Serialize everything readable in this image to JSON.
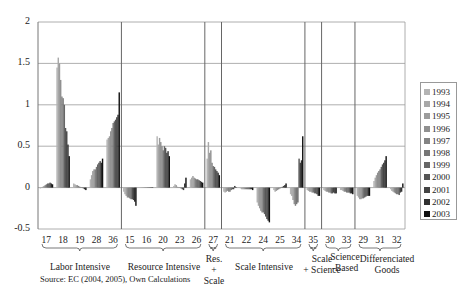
{
  "chart_data": {
    "type": "bar",
    "title": "",
    "xlabel": "",
    "ylabel": "",
    "ylim": [
      -0.5,
      2
    ],
    "yticks": [
      "2",
      "1.5",
      "1",
      "0.5",
      "0",
      "-0.5"
    ],
    "grid": true,
    "legend_position": "right",
    "series_names": [
      "1993",
      "1994",
      "1995",
      "1996",
      "1997",
      "1998",
      "1999",
      "2000",
      "2001",
      "2002",
      "2003"
    ],
    "series_colors": [
      "#b4b4b4",
      "#a8a8a8",
      "#9c9c9c",
      "#909090",
      "#838383",
      "#767676",
      "#666666",
      "#555555",
      "#444444",
      "#303030",
      "#111111"
    ],
    "categories": [
      "17",
      "18",
      "19",
      "28",
      "36",
      "15",
      "16",
      "20",
      "23",
      "26",
      "27",
      "21",
      "22",
      "24",
      "25",
      "34",
      "35",
      "30",
      "33",
      "29",
      "31",
      "32"
    ],
    "values": {
      "17": [
        -0.01,
        0.0,
        0.01,
        0.02,
        0.03,
        0.04,
        0.05,
        0.05,
        0.06,
        0.05,
        0.04
      ],
      "18": [
        1.45,
        1.57,
        1.5,
        1.3,
        1.1,
        1.08,
        1.0,
        0.72,
        0.68,
        0.52,
        0.38
      ],
      "19": [
        0.05,
        0.04,
        0.03,
        0.03,
        0.02,
        0.01,
        0.0,
        0.0,
        -0.01,
        -0.02,
        -0.03
      ],
      "28": [
        0.1,
        0.15,
        0.2,
        0.22,
        0.22,
        0.25,
        0.28,
        0.3,
        0.32,
        0.3,
        0.35
      ],
      "36": [
        0.58,
        0.6,
        0.62,
        0.68,
        0.72,
        0.78,
        0.8,
        0.82,
        0.85,
        0.88,
        1.15
      ],
      "15": [
        -0.05,
        -0.08,
        -0.1,
        -0.12,
        -0.12,
        -0.13,
        -0.14,
        -0.14,
        -0.15,
        -0.17,
        -0.22
      ],
      "16": [
        0.0,
        0.0,
        0.0,
        0.0,
        0.0,
        0.0,
        0.0,
        0.0,
        0.0,
        0.0,
        0.0
      ],
      "20": [
        0.62,
        0.52,
        0.6,
        0.55,
        0.5,
        0.45,
        0.5,
        0.48,
        0.42,
        0.44,
        0.38
      ],
      "23": [
        0.02,
        0.04,
        0.03,
        0.01,
        0.0,
        0.0,
        -0.01,
        -0.02,
        -0.03,
        0.05,
        0.12
      ],
      "26": [
        0.1,
        0.12,
        0.14,
        0.12,
        0.11,
        0.1,
        0.1,
        0.09,
        0.08,
        0.07,
        0.06
      ],
      "27": [
        0.35,
        0.55,
        0.42,
        0.45,
        0.3,
        0.26,
        0.25,
        0.22,
        0.2,
        0.18,
        0.15
      ],
      "21": [
        -0.05,
        -0.06,
        -0.05,
        -0.04,
        -0.05,
        -0.05,
        -0.03,
        -0.02,
        -0.02,
        0.02,
        0.0
      ],
      "22": [
        -0.01,
        -0.02,
        -0.02,
        -0.02,
        -0.02,
        -0.02,
        -0.02,
        -0.02,
        -0.02,
        -0.02,
        -0.03
      ],
      "24": [
        -0.18,
        -0.22,
        -0.25,
        -0.28,
        -0.3,
        -0.3,
        -0.32,
        -0.35,
        -0.38,
        -0.4,
        -0.42
      ],
      "25": [
        -0.03,
        -0.05,
        -0.04,
        -0.03,
        -0.02,
        -0.01,
        0.0,
        0.01,
        0.02,
        0.03,
        0.05
      ],
      "34": [
        -0.08,
        -0.1,
        -0.15,
        -0.2,
        -0.22,
        -0.2,
        -0.18,
        0.35,
        0.3,
        0.33,
        0.62
      ],
      "35": [
        -0.03,
        -0.04,
        -0.05,
        -0.05,
        -0.06,
        -0.06,
        -0.07,
        -0.07,
        -0.08,
        -0.1,
        -0.1
      ],
      "30": [
        -0.03,
        -0.04,
        -0.05,
        -0.05,
        -0.06,
        -0.06,
        -0.07,
        -0.07,
        -0.06,
        -0.07,
        -0.07
      ],
      "33": [
        -0.03,
        -0.03,
        -0.04,
        -0.05,
        -0.05,
        -0.06,
        -0.06,
        -0.06,
        -0.07,
        -0.07,
        -0.08
      ],
      "29": [
        -0.1,
        -0.12,
        -0.14,
        -0.14,
        -0.13,
        -0.13,
        -0.12,
        -0.11,
        -0.1,
        -0.1,
        -0.1
      ],
      "31": [
        0.08,
        0.12,
        0.15,
        0.18,
        0.2,
        0.22,
        0.25,
        0.28,
        0.3,
        0.33,
        0.38
      ],
      "32": [
        -0.02,
        -0.04,
        -0.05,
        -0.06,
        -0.07,
        -0.08,
        -0.08,
        -0.09,
        -0.06,
        -0.05,
        0.05
      ]
    },
    "groups": [
      {
        "label": "Labor Intensive",
        "categories": [
          "17",
          "18",
          "19",
          "28",
          "36"
        ]
      },
      {
        "label": "Resource Intensive",
        "categories": [
          "15",
          "16",
          "20",
          "23",
          "26"
        ]
      },
      {
        "label": "Res. + Scale",
        "categories": [
          "27"
        ]
      },
      {
        "label": "Scale Intensive",
        "categories": [
          "21",
          "22",
          "24",
          "25",
          "34"
        ]
      },
      {
        "label": "Scale + Science",
        "categories": [
          "35"
        ]
      },
      {
        "label": "Science -Based",
        "categories": [
          "30",
          "33"
        ]
      },
      {
        "label": "Differenciated Goods",
        "categories": [
          "29",
          "31",
          "32"
        ]
      }
    ],
    "annotations": [
      "Source: EC (2004, 2005), Own Calculations"
    ]
  },
  "labels": {
    "groups": {
      "labor": "Labor Intensive",
      "resource": "Resource Intensive",
      "res_scale_1": "Res.",
      "res_scale_2": "+ Scale",
      "scale": "Scale Intensive",
      "scale_science_1": "Scale",
      "scale_science_2": "+ Science",
      "science_1": "Science",
      "science_2": "-Based",
      "diff_1": "Differenciated",
      "diff_2": "Goods"
    },
    "source": "Source: EC (2004, 2005), Own Calculations"
  }
}
